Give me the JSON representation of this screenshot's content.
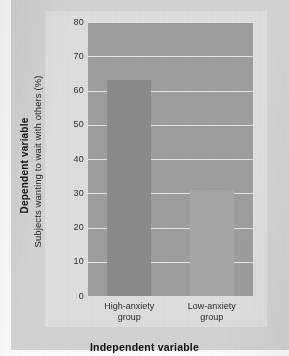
{
  "chart_data": {
    "type": "bar",
    "title": "",
    "categories": [
      "High-anxiety group",
      "Low-anxiety group"
    ],
    "category_lines": [
      [
        "High-anxiety",
        "group"
      ],
      [
        "Low-anxiety",
        "group"
      ]
    ],
    "values": [
      63,
      31
    ],
    "xlabel": "Independent variable",
    "ylabel": "Subjects wanting to wait with others (%)",
    "ylim": [
      0,
      80
    ],
    "ytick_labels": [
      "80",
      "70",
      "60",
      "50",
      "40",
      "30",
      "20",
      "10",
      "0"
    ],
    "ytick_values": [
      80,
      70,
      60,
      50,
      40,
      30,
      20,
      10,
      0
    ],
    "ytick_step": 10,
    "grid": true,
    "legend": "none",
    "colors": {
      "plot_background": "#9e9e9e",
      "gridline": "#e9e9e9",
      "bar_high_anxiety": "#8b8b8b",
      "bar_low_anxiety": "#a6a6a6",
      "panel_background": "#dededd",
      "frame_background": "#d3d3d2",
      "page_background": "#fbfbfa",
      "text": "#232323"
    }
  },
  "axis_titles": {
    "dependent_variable": "Dependent variable",
    "independent_variable": "Independent variable",
    "y_measure": "Subjects wanting to wait with others (%)"
  }
}
